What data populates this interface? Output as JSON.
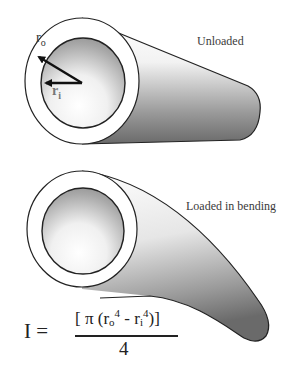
{
  "diagram": {
    "top_tube": {
      "state_label": "Unloaded",
      "outer_radius_label": "r",
      "outer_radius_sub": "o",
      "inner_radius_label": "r",
      "inner_radius_sub": "i"
    },
    "bottom_tube": {
      "state_label": "Loaded in bending"
    },
    "formula": {
      "lhs": "I =",
      "numerator_open": "[ π (r",
      "ro_sub": "o",
      "exp1": "4",
      "minus": " - r",
      "ri_sub": "i",
      "exp2": "4",
      "numerator_close": ")]",
      "denominator": "4"
    },
    "colors": {
      "stroke": "#222222",
      "shade_dark": "#6e6e6e",
      "shade_light": "#ffffff"
    }
  }
}
